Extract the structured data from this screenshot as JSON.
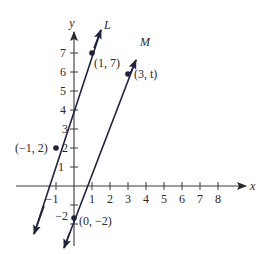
{
  "figure": {
    "type": "coordinate-plane",
    "axes": {
      "x_label": "x",
      "y_label": "y",
      "x_ticks": [
        "−1",
        "1",
        "2",
        "3",
        "4",
        "5",
        "6",
        "7",
        "8"
      ],
      "y_ticks": [
        "1",
        "2",
        "3",
        "4",
        "5",
        "6",
        "7",
        "−2"
      ]
    },
    "lines": [
      {
        "name": "L",
        "label": "L",
        "color": "#1f2340",
        "points": [
          [
            -1,
            2
          ],
          [
            1,
            7
          ]
        ]
      },
      {
        "name": "M",
        "label": "M",
        "color": "#1f2340",
        "points": [
          [
            0,
            -2
          ],
          [
            3,
            "t"
          ]
        ]
      }
    ],
    "point_labels": {
      "p1": "(−1, 2)",
      "p2": "(1, 7)",
      "p3": "(3, t)",
      "p4": "(0, −2)"
    },
    "colors": {
      "ink": "#1f2340",
      "axis": "#3a3a3a"
    }
  }
}
